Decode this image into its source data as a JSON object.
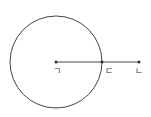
{
  "diagram": {
    "circle": {
      "cx": 56,
      "cy": 62,
      "r": 46,
      "stroke": "#444444"
    },
    "segment": {
      "x1": 56,
      "y1": 62,
      "x2": 139,
      "y2": 62
    },
    "points": [
      {
        "id": "center",
        "label": "ㄱ",
        "x": 56,
        "y": 62
      },
      {
        "id": "intersection",
        "label": "ㄷ",
        "x": 102,
        "y": 62
      },
      {
        "id": "end",
        "label": "ㄴ",
        "x": 139,
        "y": 62
      }
    ]
  }
}
